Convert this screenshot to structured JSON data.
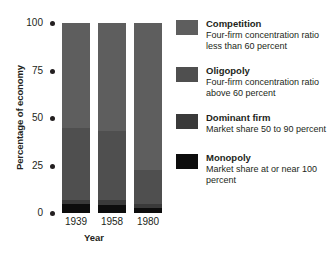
{
  "chart_data": {
    "type": "bar",
    "subtype": "stacked-column",
    "title": "",
    "xlabel": "Year",
    "ylabel": "Percentage of economy",
    "categories": [
      "1939",
      "1958",
      "1980"
    ],
    "ylim": [
      0,
      100
    ],
    "yticks": [
      0,
      25,
      50,
      75,
      100
    ],
    "ytick_labels": [
      "0",
      "25",
      "50",
      "75",
      "100"
    ],
    "grid": false,
    "legend_position": "right",
    "stack_order_bottom_to_top": [
      "Monopoly",
      "Dominant firm",
      "Oligopoly",
      "Competition"
    ],
    "series": [
      {
        "name": "Monopoly",
        "color": "#0d0d0d",
        "values": [
          5.0,
          4.0,
          2.5
        ]
      },
      {
        "name": "Dominant firm",
        "color": "#3a3a3a",
        "values": [
          2.0,
          3.0,
          2.0
        ]
      },
      {
        "name": "Oligopoly",
        "color": "#4f4f4f",
        "values": [
          38.0,
          36.0,
          18.0
        ]
      },
      {
        "name": "Competition",
        "color": "#5e5e5e",
        "values": [
          55.0,
          57.0,
          77.5
        ]
      }
    ]
  },
  "axes": {
    "y_title": "Percentage of economy",
    "x_title": "Year"
  },
  "legend": {
    "items": [
      {
        "label": "Competition",
        "description": "Four-firm concentration ratio less than 60 percent",
        "swatch": "#5e5e5e"
      },
      {
        "label": "Oligopoly",
        "description": "Four-firm concentration ratio above 60 percent",
        "swatch": "#4f4f4f"
      },
      {
        "label": "Dominant firm",
        "description": "Market share 50 to 90 percent",
        "swatch": "#3a3a3a"
      },
      {
        "label": "Monopoly",
        "description": "Market share at or near 100 percent",
        "swatch": "#0d0d0d"
      }
    ]
  },
  "colors": {
    "background": "#ffffff",
    "ink": "#231f20"
  }
}
